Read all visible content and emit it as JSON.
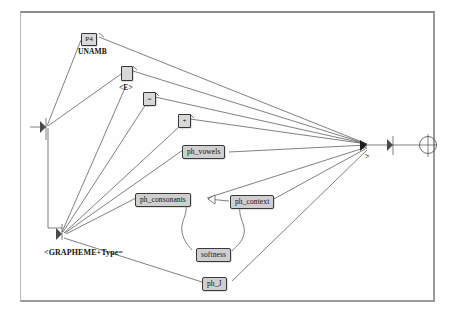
{
  "diagram": {
    "frame": {
      "border_color": "#8c8c8c",
      "background": "#ffffff"
    },
    "nodes": [
      {
        "id": "p4",
        "label": "P4",
        "kind": "operator-box",
        "x": 81,
        "y": 33
      },
      {
        "id": "unamb",
        "label": "UNAMB",
        "kind": "text",
        "x": 78,
        "y": 47
      },
      {
        "id": "e-box",
        "label": "",
        "kind": "operator-box",
        "x": 121,
        "y": 66
      },
      {
        "id": "e-label",
        "label": "<E>",
        "kind": "text",
        "x": 119,
        "y": 83
      },
      {
        "id": "eq-box",
        "label": "=",
        "kind": "operator-box",
        "x": 143,
        "y": 92
      },
      {
        "id": "eq-sub",
        "label": "'",
        "kind": "tiny-text",
        "x": 147,
        "y": 105
      },
      {
        "id": "plus-box",
        "label": "+",
        "kind": "operator-box",
        "x": 178,
        "y": 114
      },
      {
        "id": "plus-sub",
        "label": "'",
        "kind": "tiny-text",
        "x": 182,
        "y": 128
      },
      {
        "id": "ph_vowels",
        "label": "ph_vowels",
        "kind": "label-box",
        "x": 182,
        "y": 145
      },
      {
        "id": "ph_consonants",
        "label": "ph_consonants",
        "kind": "label-box",
        "x": 135,
        "y": 193
      },
      {
        "id": "ph_context",
        "label": "ph_context",
        "kind": "label-box",
        "x": 230,
        "y": 195
      },
      {
        "id": "softness",
        "label": "softness",
        "kind": "label-box",
        "x": 196,
        "y": 248
      },
      {
        "id": "ph_J",
        "label": "ph_J",
        "kind": "label-box",
        "x": 202,
        "y": 277
      },
      {
        "id": "grapheme",
        "label": "<GRAPHEME+Type=",
        "kind": "text",
        "x": 44,
        "y": 248
      }
    ],
    "junctions": [
      {
        "id": "left-fan",
        "x": 46,
        "y": 127,
        "caret": ""
      },
      {
        "id": "bottom-fan",
        "x": 62,
        "y": 233,
        "caret": ""
      },
      {
        "id": "right-fan",
        "x": 368,
        "y": 145,
        "caret": ">"
      },
      {
        "id": "right-bar",
        "x": 393,
        "y": 145,
        "caret": ""
      },
      {
        "id": "terminal",
        "x": 428,
        "y": 145,
        "caret": ""
      }
    ],
    "terminal_symbol": "crossed-circle",
    "line_color": "#4a4a4a"
  }
}
